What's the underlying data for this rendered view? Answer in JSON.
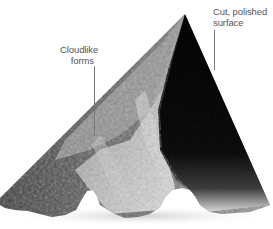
{
  "figure": {
    "annotations": [
      {
        "id": "cut",
        "lines": [
          "Cut, polished",
          "surface"
        ]
      },
      {
        "id": "cloud",
        "lines": [
          "Cloudlike",
          "forms"
        ]
      }
    ]
  },
  "colors": {
    "background": "#ffffff",
    "polished_face": "#050505",
    "label_text": "#555555",
    "leader_line": "#777777"
  }
}
